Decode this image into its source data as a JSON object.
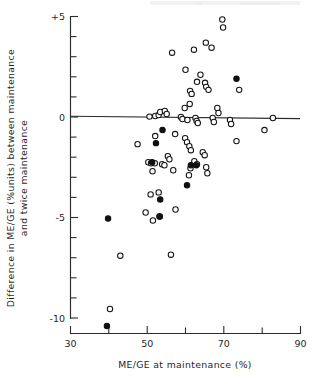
{
  "chart_data": {
    "type": "scatter",
    "title": "",
    "xlabel": "ME/GE at maintenance (%)",
    "ylabel": "Difference in ME/GE (% units) between maintenance and twice maintenance",
    "xlim": [
      30,
      90
    ],
    "ylim": [
      -10.8,
      5
    ],
    "xticks": [
      30,
      40,
      50,
      60,
      70,
      80,
      90
    ],
    "xticklabels": [
      "30",
      "",
      "50",
      "",
      "70",
      "",
      "90"
    ],
    "yticks": [
      5,
      4,
      3,
      2,
      1,
      0,
      -1,
      -2,
      -3,
      -4,
      -5,
      -6,
      -7,
      -8,
      -9,
      -10
    ],
    "yticklabels": [
      "+5",
      "",
      "",
      "",
      "",
      "0",
      "",
      "",
      "",
      "",
      "-5",
      "",
      "",
      "",
      "",
      "-10"
    ],
    "grid": false,
    "legend": null,
    "reference_lines": [
      {
        "orientation": "horizontal",
        "value": 0,
        "label": "zero-difference line"
      }
    ],
    "series": [
      {
        "name": "open-circles",
        "marker": "open circle",
        "marker_color": "#ffffff",
        "edge_color": "#141414",
        "points": [
          [
            69.6,
            4.85
          ],
          [
            69.8,
            4.45
          ],
          [
            65.3,
            3.7
          ],
          [
            66.8,
            3.45
          ],
          [
            62.2,
            3.35
          ],
          [
            56.5,
            3.2
          ],
          [
            60.0,
            2.35
          ],
          [
            63.9,
            2.1
          ],
          [
            63.0,
            1.75
          ],
          [
            65.1,
            1.7
          ],
          [
            65.4,
            1.5
          ],
          [
            66.0,
            1.35
          ],
          [
            61.2,
            1.3
          ],
          [
            61.6,
            1.15
          ],
          [
            74.0,
            1.35
          ],
          [
            61.1,
            0.65
          ],
          [
            59.8,
            0.45
          ],
          [
            68.3,
            0.45
          ],
          [
            68.6,
            0.2
          ],
          [
            50.6,
            0.02
          ],
          [
            52.1,
            0.05
          ],
          [
            53.0,
            0.1
          ],
          [
            53.4,
            0.25
          ],
          [
            54.6,
            0.3
          ],
          [
            55.1,
            0.15
          ],
          [
            58.8,
            0.0
          ],
          [
            59.2,
            -0.1
          ],
          [
            60.5,
            -0.15
          ],
          [
            62.6,
            -0.05
          ],
          [
            62.9,
            -0.2
          ],
          [
            63.2,
            -0.3
          ],
          [
            67.1,
            -0.05
          ],
          [
            67.4,
            -0.25
          ],
          [
            71.6,
            -0.15
          ],
          [
            71.9,
            -0.35
          ],
          [
            82.8,
            -0.05
          ],
          [
            80.6,
            -0.65
          ],
          [
            57.3,
            -0.85
          ],
          [
            52.1,
            -0.95
          ],
          [
            59.9,
            -1.05
          ],
          [
            60.4,
            -1.25
          ],
          [
            73.3,
            -1.2
          ],
          [
            47.5,
            -1.35
          ],
          [
            61.0,
            -1.45
          ],
          [
            61.4,
            -1.65
          ],
          [
            55.4,
            -1.95
          ],
          [
            55.8,
            -2.1
          ],
          [
            64.5,
            -1.75
          ],
          [
            65.0,
            -1.9
          ],
          [
            62.3,
            -2.2
          ],
          [
            63.0,
            -2.35
          ],
          [
            50.3,
            -2.25
          ],
          [
            51.0,
            -2.3
          ],
          [
            52.0,
            -2.3
          ],
          [
            53.9,
            -2.35
          ],
          [
            54.5,
            -2.4
          ],
          [
            65.4,
            -2.5
          ],
          [
            65.7,
            -2.8
          ],
          [
            51.4,
            -2.7
          ],
          [
            56.8,
            -2.65
          ],
          [
            60.9,
            -2.9
          ],
          [
            61.3,
            -2.55
          ],
          [
            50.9,
            -3.85
          ],
          [
            53.0,
            -3.75
          ],
          [
            49.6,
            -4.75
          ],
          [
            57.4,
            -4.6
          ],
          [
            51.5,
            -5.15
          ],
          [
            53.2,
            -4.95
          ],
          [
            43.0,
            -6.9
          ],
          [
            56.2,
            -6.85
          ],
          [
            40.3,
            -9.55
          ]
        ]
      },
      {
        "name": "filled-circles",
        "marker": "filled circle",
        "marker_color": "#101010",
        "edge_color": "#101010",
        "points": [
          [
            73.3,
            1.9
          ],
          [
            54.0,
            -0.65
          ],
          [
            52.3,
            -1.3
          ],
          [
            51.3,
            -2.25
          ],
          [
            61.4,
            -2.4
          ],
          [
            62.8,
            -2.4
          ],
          [
            60.4,
            -3.4
          ],
          [
            53.4,
            -4.1
          ],
          [
            53.3,
            -4.95
          ],
          [
            39.8,
            -5.05
          ],
          [
            39.5,
            -10.4
          ]
        ]
      }
    ]
  },
  "axes": {
    "x_tick_labels": [
      {
        "value": 30,
        "text": "30"
      },
      {
        "value": 50,
        "text": "50"
      },
      {
        "value": 70,
        "text": "70"
      },
      {
        "value": 90,
        "text": "90"
      }
    ],
    "y_tick_labels": [
      {
        "value": 5,
        "text": "+5"
      },
      {
        "value": 0,
        "text": "0"
      },
      {
        "value": -5,
        "text": "-5"
      },
      {
        "value": -10,
        "text": "-10"
      }
    ],
    "x_axis_title": "ME/GE at maintenance (%)",
    "y_axis_title_line1": "Difference in ME/GE (%units) between maintenance",
    "y_axis_title_line2": "and twice maintenance"
  },
  "colors": {
    "ink": "#1f1f1f",
    "marker_edge": "#141414",
    "marker_fill_open": "#ffffff",
    "marker_fill_solid": "#101010",
    "background": "#ffffff"
  }
}
